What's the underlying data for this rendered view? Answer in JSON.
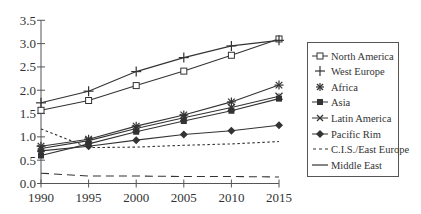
{
  "chart_data": {
    "type": "line",
    "title": "",
    "xlabel": "",
    "ylabel": "",
    "x": [
      1990,
      1995,
      2000,
      2005,
      2010,
      2015
    ],
    "xticks": [
      "1990",
      "1995",
      "2000",
      "2005",
      "2010",
      "2015"
    ],
    "yticks": [
      "0.0",
      "0.5",
      "1.0",
      "1.5",
      "2.0",
      "2.5",
      "3.0",
      "3.5"
    ],
    "ylim": [
      0,
      3.5
    ],
    "xlim": [
      1990,
      2015
    ],
    "grid": false,
    "legend_position": "right",
    "series": [
      {
        "name": "North America",
        "marker": "square-open",
        "style": "solid",
        "values": [
          1.57,
          1.78,
          2.1,
          2.41,
          2.75,
          3.1
        ]
      },
      {
        "name": "West Europe",
        "marker": "plus",
        "style": "solid",
        "values": [
          1.73,
          1.98,
          2.4,
          2.7,
          2.95,
          3.07
        ]
      },
      {
        "name": "Africa",
        "marker": "asterisk",
        "style": "solid",
        "values": [
          0.8,
          0.95,
          1.23,
          1.47,
          1.75,
          2.11
        ]
      },
      {
        "name": "Asia",
        "marker": "square-filled",
        "style": "solid",
        "values": [
          0.6,
          0.85,
          1.11,
          1.34,
          1.56,
          1.82
        ]
      },
      {
        "name": "Latin America",
        "marker": "x-star",
        "style": "solid",
        "values": [
          0.75,
          0.92,
          1.18,
          1.41,
          1.63,
          1.87
        ]
      },
      {
        "name": "Pacific Rim",
        "marker": "diamond-filled",
        "style": "solid",
        "values": [
          0.7,
          0.8,
          0.93,
          1.05,
          1.13,
          1.25
        ]
      },
      {
        "name": "C.I.S./East Europe",
        "marker": "none",
        "style": "dotted",
        "values": [
          1.17,
          0.77,
          0.78,
          0.82,
          0.85,
          0.9
        ]
      },
      {
        "name": "Middle East",
        "marker": "none",
        "style": "dashed",
        "values": [
          0.22,
          0.16,
          0.16,
          0.15,
          0.15,
          0.14
        ]
      }
    ]
  },
  "legend": {
    "items": [
      {
        "label": "North America"
      },
      {
        "label": "West Europe"
      },
      {
        "label": "Africa"
      },
      {
        "label": "Asia"
      },
      {
        "label": "Latin America"
      },
      {
        "label": "Pacific Rim"
      },
      {
        "label": "C.I.S./East Europe"
      },
      {
        "label": "Middle East"
      }
    ]
  },
  "colors": {
    "line": "#333333",
    "axis": "#555555",
    "text": "#333333"
  }
}
